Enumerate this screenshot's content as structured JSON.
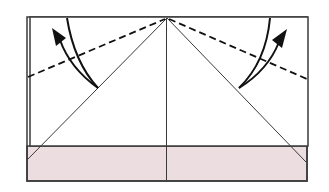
{
  "diagram": {
    "colors": {
      "paper_front": "#ffffff",
      "paper_back": "#ecdde0",
      "line": "#3a3a3a",
      "arrow": "#111111"
    },
    "elements": {
      "paper": "paper",
      "flap": "white flap",
      "band": "pink band",
      "left_valley_fold": "left dashed fold line",
      "right_valley_fold": "right dashed fold line",
      "left_arrow": "left fold arrow",
      "right_arrow": "right fold arrow"
    }
  }
}
